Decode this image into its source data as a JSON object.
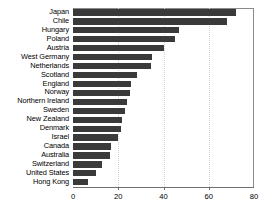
{
  "chart_data": {
    "type": "bar",
    "orientation": "horizontal",
    "title": "",
    "xlabel": "",
    "ylabel": "",
    "xlim": [
      0,
      80
    ],
    "ylim": null,
    "grid": true,
    "grid_axis": "x",
    "legend": null,
    "bar_color": "#3a3a3a",
    "xticks": [
      0,
      20,
      40,
      60,
      80
    ],
    "xtick_labels": [
      "0",
      "20",
      "40",
      "60",
      "80"
    ],
    "categories": [
      "Japan",
      "Chile",
      "Hungary",
      "Poland",
      "Austria",
      "West Germany",
      "Netherlands",
      "Scotland",
      "England",
      "Norway",
      "Northern Ireland",
      "Sweden",
      "New Zealand",
      "Denmark",
      "Israel",
      "Canada",
      "Australia",
      "Switzerland",
      "United States",
      "Hong Kong"
    ],
    "values": [
      72,
      68,
      47,
      45,
      40,
      35,
      34.5,
      28.5,
      25.5,
      25,
      24,
      23,
      21.5,
      21,
      20,
      17,
      16.5,
      13,
      10,
      6.5
    ]
  }
}
